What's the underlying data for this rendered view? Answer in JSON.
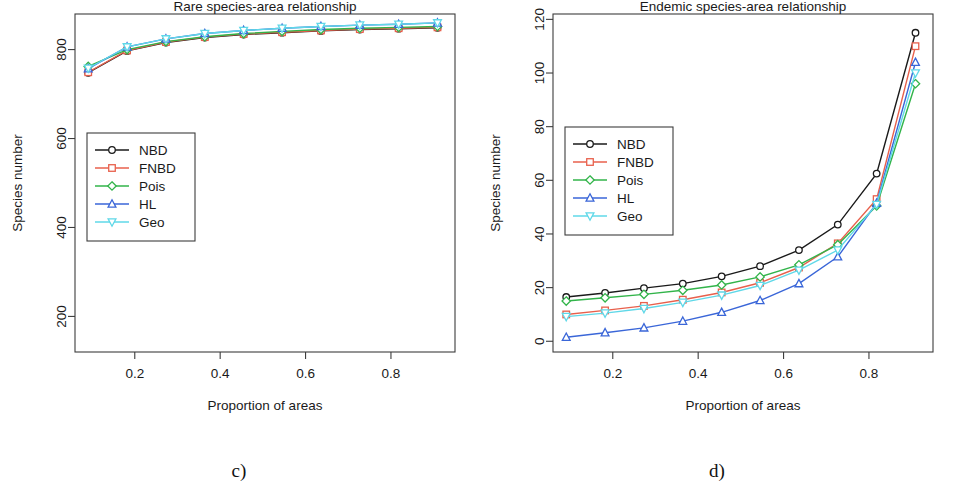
{
  "figure": {
    "panels": [
      {
        "id": "c",
        "caption": "c)",
        "title": "Rare species-area relationship",
        "xlabel": "Proportion of areas",
        "ylabel": "Species number"
      },
      {
        "id": "d",
        "caption": "d)",
        "title": "Endemic species-area relationship",
        "xlabel": "Proportion of areas",
        "ylabel": "Species number"
      }
    ]
  },
  "legend": {
    "entries": [
      {
        "label": "NBD",
        "color": "#1a1a1a",
        "marker": "circle"
      },
      {
        "label": "FNBD",
        "color": "#e8604c",
        "marker": "square"
      },
      {
        "label": "Pois",
        "color": "#32b44a",
        "marker": "diamond"
      },
      {
        "label": "HL",
        "color": "#3a66d8",
        "marker": "triangle"
      },
      {
        "label": "Geo",
        "color": "#5fd8e8",
        "marker": "triangle-down"
      }
    ]
  },
  "chart_data": [
    {
      "type": "line",
      "panel": "c",
      "title": "Rare species-area relationship",
      "xlabel": "Proportion of areas",
      "ylabel": "Species number",
      "xlim": [
        0.06,
        0.95
      ],
      "ylim": [
        120,
        880
      ],
      "xticks": [
        0.2,
        0.4,
        0.6,
        0.8
      ],
      "xtick_labels": [
        "0.2",
        "0.4",
        "0.6",
        "0.8"
      ],
      "yticks": [
        200,
        400,
        600,
        800
      ],
      "ytick_labels": [
        "200",
        "400",
        "600",
        "800"
      ],
      "grid": false,
      "legend_position": "center-left",
      "x": [
        0.091,
        0.182,
        0.273,
        0.364,
        0.455,
        0.545,
        0.636,
        0.727,
        0.818,
        0.909
      ],
      "series": [
        {
          "name": "NBD",
          "color": "#1a1a1a",
          "marker": "circle",
          "values": [
            748,
            797,
            816,
            827,
            834,
            838,
            842,
            845,
            847,
            849
          ]
        },
        {
          "name": "FNBD",
          "color": "#e8604c",
          "marker": "square",
          "values": [
            749,
            798,
            817,
            828,
            835,
            839,
            843,
            846,
            848,
            850
          ]
        },
        {
          "name": "Pois",
          "color": "#32b44a",
          "marker": "diamond",
          "values": [
            762,
            800,
            818,
            829,
            836,
            841,
            845,
            848,
            850,
            852
          ]
        },
        {
          "name": "HL",
          "color": "#3a66d8",
          "marker": "triangle",
          "values": [
            757,
            806,
            824,
            836,
            843,
            848,
            852,
            855,
            857,
            860
          ]
        },
        {
          "name": "Geo",
          "color": "#5fd8e8",
          "marker": "triangle-down",
          "values": [
            758,
            806,
            824,
            836,
            843,
            848,
            852,
            855,
            857,
            860
          ]
        }
      ]
    },
    {
      "type": "line",
      "panel": "d",
      "title": "Endemic species-area relationship",
      "xlabel": "Proportion of areas",
      "ylabel": "Species number",
      "xlim": [
        0.06,
        0.95
      ],
      "ylim": [
        -4,
        122
      ],
      "xticks": [
        0.2,
        0.4,
        0.6,
        0.8
      ],
      "xtick_labels": [
        "0.2",
        "0.4",
        "0.6",
        "0.8"
      ],
      "yticks": [
        0,
        20,
        40,
        60,
        80,
        100,
        120
      ],
      "ytick_labels": [
        "0",
        "20",
        "40",
        "60",
        "80",
        "100",
        "120"
      ],
      "grid": false,
      "legend_position": "center-left",
      "x": [
        0.091,
        0.182,
        0.273,
        0.364,
        0.455,
        0.545,
        0.636,
        0.727,
        0.818,
        0.909
      ],
      "series": [
        {
          "name": "NBD",
          "color": "#1a1a1a",
          "marker": "circle",
          "values": [
            16.5,
            18.0,
            19.8,
            21.5,
            24.2,
            28.0,
            34.0,
            43.5,
            62.5,
            115.0
          ]
        },
        {
          "name": "FNBD",
          "color": "#e8604c",
          "marker": "square",
          "values": [
            10.0,
            11.5,
            13.2,
            15.5,
            18.2,
            21.8,
            27.5,
            36.5,
            53.0,
            110.0
          ]
        },
        {
          "name": "Pois",
          "color": "#32b44a",
          "marker": "diamond",
          "values": [
            15.0,
            16.2,
            17.5,
            19.0,
            21.0,
            24.0,
            28.5,
            36.0,
            50.5,
            96.0
          ]
        },
        {
          "name": "HL",
          "color": "#3a66d8",
          "marker": "triangle",
          "values": [
            1.5,
            3.2,
            5.0,
            7.5,
            10.8,
            15.2,
            21.5,
            31.5,
            51.5,
            104.0
          ]
        },
        {
          "name": "Geo",
          "color": "#5fd8e8",
          "marker": "triangle-down",
          "values": [
            9.2,
            10.5,
            12.2,
            14.5,
            17.2,
            20.8,
            26.5,
            34.0,
            51.0,
            100.0
          ]
        }
      ]
    }
  ]
}
